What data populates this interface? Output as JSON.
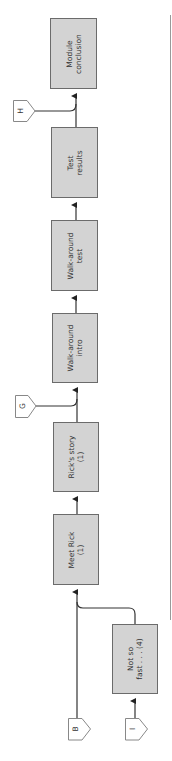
{
  "diagram": {
    "type": "flowchart",
    "orientation": "rotated -90deg (flow bottom-to-top)",
    "colors": {
      "box_fill": "#d3d3d3",
      "box_border": "#6b6b6b",
      "line": "#333333",
      "tag_border": "#888888",
      "margin_rule": "#999999"
    },
    "nodes": [
      {
        "id": "module-conclusion",
        "line1": "Module",
        "line2": "conclusion"
      },
      {
        "id": "test-results",
        "line1": "Test",
        "line2": "results"
      },
      {
        "id": "walk-around-test",
        "line1": "Walk-around",
        "line2": "test"
      },
      {
        "id": "walk-around-intro",
        "line1": "Walk-around",
        "line2": "intro"
      },
      {
        "id": "ricks-story",
        "line1": "Rick's story",
        "line2": "(1)"
      },
      {
        "id": "meet-rick",
        "line1": "Meet Rick",
        "line2": "(1)"
      },
      {
        "id": "not-so-fast",
        "line1": "Not so",
        "line2": "fast . . . (4)"
      }
    ],
    "connectors": [
      {
        "id": "H",
        "label": "H"
      },
      {
        "id": "G",
        "label": "G"
      },
      {
        "id": "B",
        "label": "B"
      },
      {
        "id": "I",
        "label": "I"
      }
    ],
    "edges": [
      [
        "B",
        "meet-rick"
      ],
      [
        "not-so-fast",
        "meet-rick"
      ],
      [
        "I",
        "not-so-fast"
      ],
      [
        "meet-rick",
        "ricks-story"
      ],
      [
        "ricks-story",
        "walk-around-intro"
      ],
      [
        "G",
        "walk-around-intro"
      ],
      [
        "walk-around-intro",
        "walk-around-test"
      ],
      [
        "walk-around-test",
        "test-results"
      ],
      [
        "test-results",
        "module-conclusion"
      ],
      [
        "H",
        "module-conclusion"
      ]
    ]
  }
}
